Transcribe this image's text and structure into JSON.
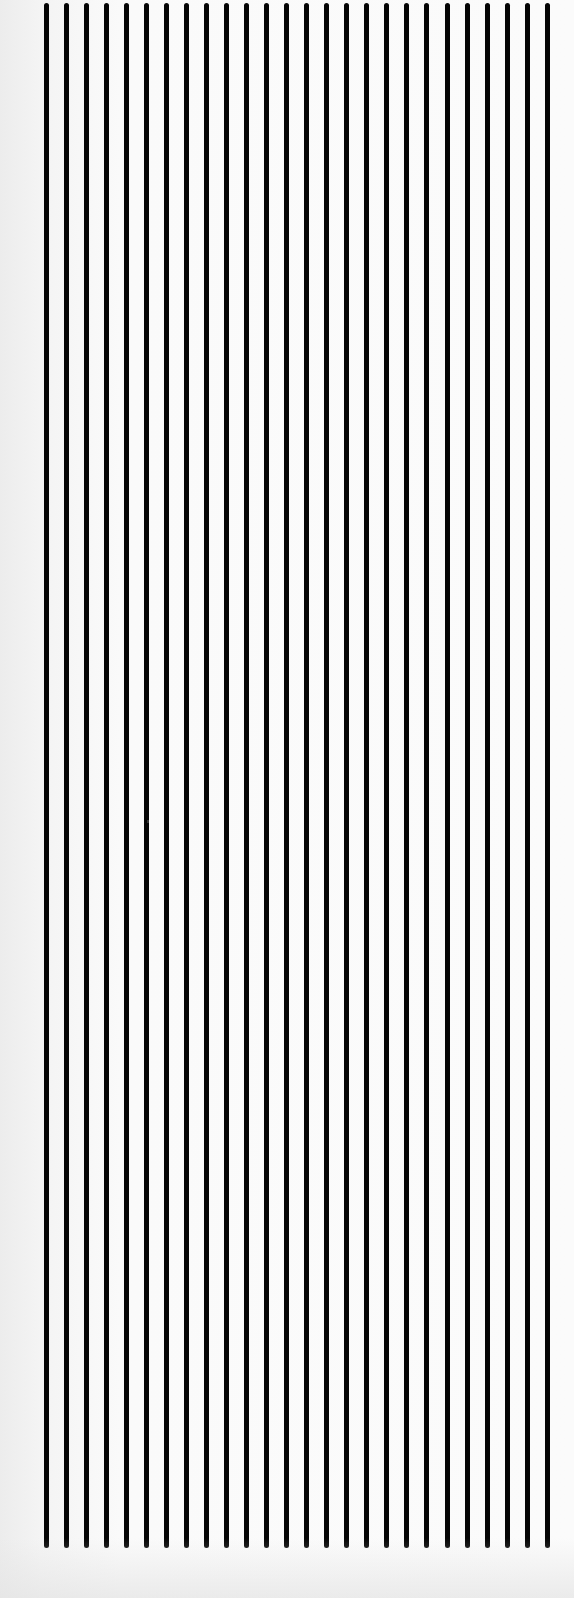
{
  "pattern": {
    "description": "Scanned sheet of evenly spaced vertical black lines",
    "line_count": 26,
    "first_line_x": 46,
    "spacing_px": 20.05,
    "line_width_px": 5,
    "line_top_y": 3,
    "line_bottom_y": 1548,
    "line_color": "#050505",
    "background_color": "#f6f6f6"
  }
}
